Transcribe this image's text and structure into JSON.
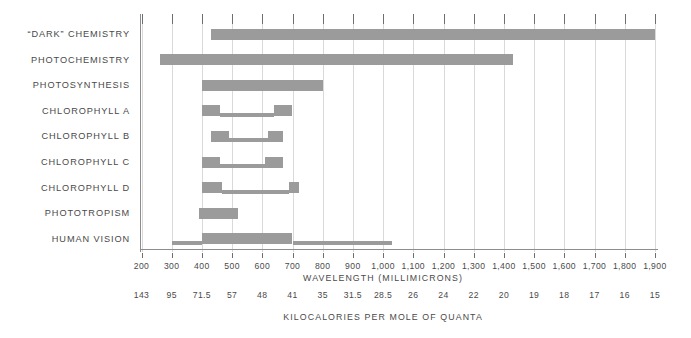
{
  "chart_data": {
    "type": "bar",
    "title": "",
    "subtitle": "",
    "orientation": "horizontal",
    "xlabel": "WAVELENGTH  (MILLIMICRONS)",
    "xlabel_secondary": "KILOCALORIES  PER  MOLE  OF  QUANTA",
    "ylabel": "",
    "xlim": [
      170,
      1930
    ],
    "grid": true,
    "legend": false,
    "bar_color": "#9b9b9b",
    "axis_color": "#8d8d8d",
    "grid_color": "#d9d9d9",
    "categories": [
      "“DARK”  CHEMISTRY",
      "PHOTOCHEMISTRY",
      "PHOTOSYNTHESIS",
      "CHLOROPHYLL  A",
      "CHLOROPHYLL  B",
      "CHLOROPHYLL  C",
      "CHLOROPHYLL  D",
      "PHOTOTROPISM",
      "HUMAN  VISION"
    ],
    "series": [
      {
        "name": "“DARK”  CHEMISTRY",
        "segments": [
          {
            "start": 430,
            "end": 1900,
            "weight": "thick"
          }
        ]
      },
      {
        "name": "PHOTOCHEMISTRY",
        "segments": [
          {
            "start": 260,
            "end": 1430,
            "weight": "thick"
          }
        ]
      },
      {
        "name": "PHOTOSYNTHESIS",
        "segments": [
          {
            "start": 400,
            "end": 800,
            "weight": "thick"
          }
        ]
      },
      {
        "name": "CHLOROPHYLL  A",
        "segments": [
          {
            "start": 400,
            "end": 460,
            "weight": "thick"
          },
          {
            "start": 460,
            "end": 640,
            "weight": "thin"
          },
          {
            "start": 640,
            "end": 700,
            "weight": "thick"
          }
        ]
      },
      {
        "name": "CHLOROPHYLL  B",
        "segments": [
          {
            "start": 430,
            "end": 490,
            "weight": "thick"
          },
          {
            "start": 490,
            "end": 620,
            "weight": "thin"
          },
          {
            "start": 620,
            "end": 670,
            "weight": "thick"
          }
        ]
      },
      {
        "name": "CHLOROPHYLL  C",
        "segments": [
          {
            "start": 400,
            "end": 460,
            "weight": "thick"
          },
          {
            "start": 460,
            "end": 610,
            "weight": "thin"
          },
          {
            "start": 610,
            "end": 670,
            "weight": "thick"
          }
        ]
      },
      {
        "name": "CHLOROPHYLL  D",
        "segments": [
          {
            "start": 400,
            "end": 465,
            "weight": "thick"
          },
          {
            "start": 465,
            "end": 690,
            "weight": "thin"
          },
          {
            "start": 690,
            "end": 720,
            "weight": "thick"
          }
        ]
      },
      {
        "name": "PHOTOTROPISM",
        "segments": [
          {
            "start": 390,
            "end": 520,
            "weight": "thick"
          }
        ]
      },
      {
        "name": "HUMAN  VISION",
        "segments": [
          {
            "start": 300,
            "end": 400,
            "weight": "thin"
          },
          {
            "start": 400,
            "end": 700,
            "weight": "thick"
          },
          {
            "start": 700,
            "end": 1030,
            "weight": "thin"
          }
        ]
      }
    ],
    "wavelength_ticks": [
      {
        "value": 200,
        "label": "200"
      },
      {
        "value": 300,
        "label": "300"
      },
      {
        "value": 400,
        "label": "400"
      },
      {
        "value": 500,
        "label": "500"
      },
      {
        "value": 600,
        "label": "600"
      },
      {
        "value": 700,
        "label": "700"
      },
      {
        "value": 800,
        "label": "800"
      },
      {
        "value": 900,
        "label": "900"
      },
      {
        "value": 1000,
        "label": "1,000"
      },
      {
        "value": 1100,
        "label": "1,100"
      },
      {
        "value": 1200,
        "label": "1,200"
      },
      {
        "value": 1300,
        "label": "1,300"
      },
      {
        "value": 1400,
        "label": "1,400"
      },
      {
        "value": 1500,
        "label": "1,500"
      },
      {
        "value": 1600,
        "label": "1,600"
      },
      {
        "value": 1700,
        "label": "1,700"
      },
      {
        "value": 1800,
        "label": "1,800"
      },
      {
        "value": 1900,
        "label": "1,900"
      }
    ],
    "kilocalorie_ticks": [
      {
        "value": 200,
        "label": "143"
      },
      {
        "value": 300,
        "label": "95"
      },
      {
        "value": 400,
        "label": "71.5"
      },
      {
        "value": 500,
        "label": "57"
      },
      {
        "value": 600,
        "label": "48"
      },
      {
        "value": 700,
        "label": "41"
      },
      {
        "value": 800,
        "label": "35"
      },
      {
        "value": 900,
        "label": "31.5"
      },
      {
        "value": 1000,
        "label": "28.5"
      },
      {
        "value": 1100,
        "label": "26"
      },
      {
        "value": 1200,
        "label": "24"
      },
      {
        "value": 1300,
        "label": "22"
      },
      {
        "value": 1400,
        "label": "20"
      },
      {
        "value": 1500,
        "label": "19"
      },
      {
        "value": 1600,
        "label": "18"
      },
      {
        "value": 1700,
        "label": "17"
      },
      {
        "value": 1800,
        "label": "16"
      },
      {
        "value": 1900,
        "label": "15"
      }
    ]
  }
}
